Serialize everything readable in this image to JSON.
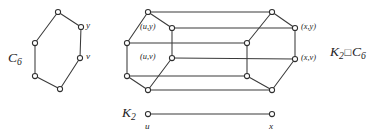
{
  "figure": {
    "caption_kind": "graph-cartesian-product",
    "background_color": "#ffffff",
    "edge_color": "#3a3a3a",
    "vertex_fill": "#ffffff",
    "vertex_stroke": "#2e2e2e",
    "text_color": "#1d1d1d"
  },
  "labels": {
    "cycle_name": "C",
    "cycle_sub": "6",
    "k2_name": "K",
    "k2_sub": "2",
    "product_k": "K",
    "product_k_sub": "2",
    "product_op": "□",
    "product_c": "C",
    "product_c_sub": "6",
    "cycle_vertex_y": "y",
    "cycle_vertex_v": "v",
    "prism_uy": "(u,y)",
    "prism_uv": "(u,v)",
    "prism_xy": "(x,y)",
    "prism_xv": "(x,v)",
    "k2_vertex_u": "u",
    "k2_vertex_x": "x"
  },
  "label_positions": {
    "cycle_name": {
      "x": 8,
      "y": 51
    },
    "cycle_vertex_y": {
      "x": 86,
      "y": 21
    },
    "cycle_vertex_v": {
      "x": 86,
      "y": 52
    },
    "prism_uy": {
      "x": 140,
      "y": 23
    },
    "prism_uv": {
      "x": 140,
      "y": 53
    },
    "prism_xy": {
      "x": 301,
      "y": 23
    },
    "prism_xv": {
      "x": 301,
      "y": 54
    },
    "product": {
      "x": 330,
      "y": 45
    },
    "k2_name": {
      "x": 122,
      "y": 106
    },
    "k2_vertex_u": {
      "x": 145,
      "y": 122
    },
    "k2_vertex_x": {
      "x": 269,
      "y": 122
    }
  },
  "chart_data": {
    "type": "diagram",
    "graphs": [
      {
        "name": "C6",
        "vertex_count": 6,
        "vertices": [
          {
            "id": "c0",
            "x": 58,
            "y": 12,
            "label": ""
          },
          {
            "id": "c1",
            "x": 81,
            "y": 27,
            "label": "y"
          },
          {
            "id": "c2",
            "x": 80,
            "y": 58,
            "label": "v"
          },
          {
            "id": "c3",
            "x": 60,
            "y": 89,
            "label": ""
          },
          {
            "id": "c4",
            "x": 35,
            "y": 76,
            "label": ""
          },
          {
            "id": "c5",
            "x": 35,
            "y": 43,
            "label": ""
          }
        ],
        "edges": [
          [
            "c0",
            "c1"
          ],
          [
            "c1",
            "c2"
          ],
          [
            "c2",
            "c3"
          ],
          [
            "c3",
            "c4"
          ],
          [
            "c4",
            "c5"
          ],
          [
            "c5",
            "c0"
          ]
        ]
      },
      {
        "name": "K2 box C6",
        "vertex_count": 12,
        "vertices": [
          {
            "id": "u0",
            "x": 148,
            "y": 12,
            "label": ""
          },
          {
            "id": "u1",
            "x": 172,
            "y": 28,
            "label": "(u,y)"
          },
          {
            "id": "u2",
            "x": 172,
            "y": 58,
            "label": "(u,v)"
          },
          {
            "id": "u3",
            "x": 148,
            "y": 90,
            "label": ""
          },
          {
            "id": "u4",
            "x": 127,
            "y": 76,
            "label": ""
          },
          {
            "id": "u5",
            "x": 127,
            "y": 43,
            "label": ""
          },
          {
            "id": "x0",
            "x": 272,
            "y": 12,
            "label": ""
          },
          {
            "id": "x1",
            "x": 295,
            "y": 28,
            "label": "(x,y)"
          },
          {
            "id": "x2",
            "x": 295,
            "y": 59,
            "label": "(x,v)"
          },
          {
            "id": "x3",
            "x": 272,
            "y": 90,
            "label": ""
          },
          {
            "id": "x4",
            "x": 247,
            "y": 76,
            "label": ""
          },
          {
            "id": "x5",
            "x": 247,
            "y": 43,
            "label": ""
          }
        ],
        "edges": [
          [
            "u0",
            "u1"
          ],
          [
            "u1",
            "u2"
          ],
          [
            "u2",
            "u3"
          ],
          [
            "u3",
            "u4"
          ],
          [
            "u4",
            "u5"
          ],
          [
            "u5",
            "u0"
          ],
          [
            "x0",
            "x1"
          ],
          [
            "x1",
            "x2"
          ],
          [
            "x2",
            "x3"
          ],
          [
            "x3",
            "x4"
          ],
          [
            "x4",
            "x5"
          ],
          [
            "x5",
            "x0"
          ],
          [
            "u0",
            "x0"
          ],
          [
            "u1",
            "x1"
          ],
          [
            "u2",
            "x2"
          ],
          [
            "u3",
            "x3"
          ],
          [
            "u4",
            "x4"
          ],
          [
            "u5",
            "x5"
          ]
        ]
      },
      {
        "name": "K2",
        "vertex_count": 2,
        "vertices": [
          {
            "id": "k0",
            "x": 148,
            "y": 114,
            "label": "u"
          },
          {
            "id": "k1",
            "x": 272,
            "y": 114,
            "label": "x"
          }
        ],
        "edges": [
          [
            "k0",
            "k1"
          ]
        ]
      }
    ]
  }
}
